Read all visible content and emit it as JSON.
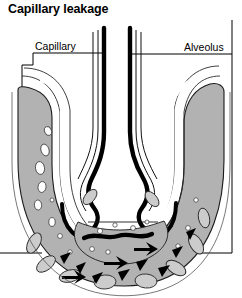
{
  "figure": {
    "title": "Capillary leakage",
    "domain": "anatomical-diagram"
  },
  "labels": {
    "capillary": "Capillary",
    "alveolus": "Alveolus"
  },
  "colors": {
    "background": "#ffffff",
    "capillary_wall_gray": "#b2b2b2",
    "outline_black": "#000000",
    "fluid_gray": "#b2b2b2",
    "lumen_white": "#ffffff",
    "frame_line": "#000000"
  },
  "structures": [
    {
      "name": "alveolar-epithelium-left",
      "style": "thick-black-line"
    },
    {
      "name": "alveolar-epithelium-right",
      "style": "thick-black-line"
    },
    {
      "name": "capillary-wall-left",
      "style": "gray-fill"
    },
    {
      "name": "capillary-wall-right",
      "style": "gray-fill"
    },
    {
      "name": "endothelial-vesicles",
      "style": "white-ovals"
    },
    {
      "name": "alveolar-space",
      "style": "white"
    },
    {
      "name": "exudate-fluid-level",
      "style": "horizontal-line"
    },
    {
      "name": "leaked-cells",
      "style": "dark-triangles"
    },
    {
      "name": "red-blood-cells",
      "style": "gray-outlined-ovals"
    }
  ],
  "leaders": {
    "capillary": {
      "from": "label-underline",
      "to_point": "capillary-wall-left"
    },
    "alveolus": {
      "from": "label-underline",
      "to_point": "alveolar-lumen"
    }
  }
}
